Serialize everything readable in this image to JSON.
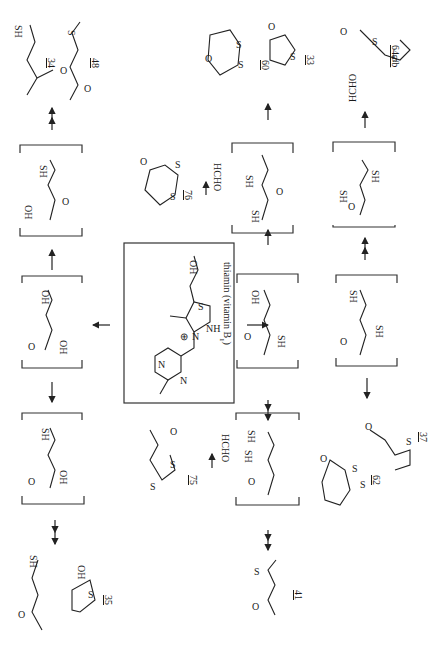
{
  "figure": {
    "orientation": "rotated 90° clockwise",
    "center_compound": {
      "name": "thiamin (vitamin B1)",
      "label": "thiamin (vitamin B",
      "subscript": "1",
      "label_close": ")",
      "atoms": [
        "N",
        "N",
        "N",
        "S",
        "NH2",
        "OH",
        "⊕"
      ]
    },
    "reagents": {
      "hcho_1": "HCHO",
      "hcho_2": "HCHO",
      "hcho_3": "HCHO"
    },
    "compounds": [
      {
        "id": "34",
        "groups": [
          "SH",
          "O"
        ]
      },
      {
        "id": "48",
        "groups": [
          "S",
          "O"
        ]
      },
      {
        "id": "60",
        "groups": [
          "O",
          "S",
          "S"
        ]
      },
      {
        "id": "33",
        "groups": [
          "O",
          "S"
        ]
      },
      {
        "id": "64a/b",
        "groups": [
          "O",
          "S",
          "S"
        ]
      },
      {
        "id": "76",
        "groups": [
          "O",
          "S",
          "S"
        ]
      },
      {
        "id": "75",
        "groups": [
          "O",
          "S",
          "S"
        ]
      },
      {
        "id": "35",
        "groups": [
          "SH",
          "O",
          "OH",
          "S"
        ]
      },
      {
        "id": "41",
        "groups": [
          "S",
          "O"
        ]
      },
      {
        "id": "62",
        "groups": [
          "O",
          "S",
          "S"
        ]
      },
      {
        "id": "37",
        "groups": [
          "O",
          "S"
        ]
      }
    ],
    "intermediates": [
      {
        "position": "top-left",
        "groups": [
          "SH",
          "OH",
          "O"
        ]
      },
      {
        "position": "left-center",
        "groups": [
          "OH",
          "OH",
          "O"
        ]
      },
      {
        "position": "bottom-left",
        "groups": [
          "SH",
          "OH",
          "O"
        ]
      },
      {
        "position": "top-center",
        "groups": [
          "SH",
          "SH",
          "O"
        ]
      },
      {
        "position": "center",
        "groups": [
          "OH",
          "SH",
          "O"
        ]
      },
      {
        "position": "bottom-center",
        "groups": [
          "SH",
          "SH",
          "O"
        ]
      },
      {
        "position": "top-right",
        "groups": [
          "SH",
          "SH",
          "O"
        ]
      },
      {
        "position": "right-center",
        "groups": [
          "SH",
          "SH",
          "O"
        ]
      }
    ],
    "labels": {
      "c34": "34",
      "c48": "48",
      "c60": "60",
      "c33": "33",
      "c64": "64a/b",
      "c76": "76",
      "c75": "75",
      "c35": "35",
      "c41": "41",
      "c62": "62",
      "c37": "37",
      "SH": "SH",
      "OH": "OH",
      "O": "O",
      "S": "S",
      "N": "N",
      "NH": "NH",
      "two": "2",
      "plus": "⊕"
    }
  }
}
